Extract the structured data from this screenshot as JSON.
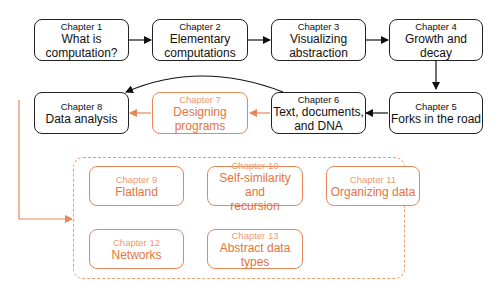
{
  "diagram": {
    "colors": {
      "core": "#222222",
      "optional": "#e57340"
    },
    "chapters": [
      {
        "id": 1,
        "chapter": "Chapter 1",
        "title": "What is computation?",
        "lines": [
          "What is",
          "computation?"
        ],
        "style": "core"
      },
      {
        "id": 2,
        "chapter": "Chapter 2",
        "title": "Elementary computations",
        "lines": [
          "Elementary",
          "computations"
        ],
        "style": "core"
      },
      {
        "id": 3,
        "chapter": "Chapter 3",
        "title": "Visualizing abstraction",
        "lines": [
          "Visualizing",
          "abstraction"
        ],
        "style": "core"
      },
      {
        "id": 4,
        "chapter": "Chapter 4",
        "title": "Growth and decay",
        "lines": [
          "Growth and decay"
        ],
        "style": "core"
      },
      {
        "id": 5,
        "chapter": "Chapter 5",
        "title": "Forks in the road",
        "lines": [
          "Forks in the road"
        ],
        "style": "core"
      },
      {
        "id": 6,
        "chapter": "Chapter 6",
        "title": "Text, documents, and DNA",
        "lines": [
          "Text, documents,",
          "and DNA"
        ],
        "style": "core"
      },
      {
        "id": 7,
        "chapter": "Chapter 7",
        "title": "Designing programs",
        "lines": [
          "Designing",
          "programs"
        ],
        "style": "optional"
      },
      {
        "id": 8,
        "chapter": "Chapter 8",
        "title": "Data analysis",
        "lines": [
          "Data analysis"
        ],
        "style": "core"
      },
      {
        "id": 9,
        "chapter": "Chapter 9",
        "title": "Flatland",
        "lines": [
          "Flatland"
        ],
        "style": "optional"
      },
      {
        "id": 10,
        "chapter": "Chapter 10",
        "title": "Self-similarity and recursion",
        "lines": [
          "Self-similarity and",
          "recursion"
        ],
        "style": "optional"
      },
      {
        "id": 11,
        "chapter": "Chapter 11",
        "title": "Organizing data",
        "lines": [
          "Organizing data"
        ],
        "style": "optional"
      },
      {
        "id": 12,
        "chapter": "Chapter 12",
        "title": "Networks",
        "lines": [
          "Networks"
        ],
        "style": "optional"
      },
      {
        "id": 13,
        "chapter": "Chapter 13",
        "title": "Abstract data types",
        "lines": [
          "Abstract data",
          "types"
        ],
        "style": "optional"
      }
    ],
    "edges": [
      {
        "from": 1,
        "to": 2,
        "style": "core"
      },
      {
        "from": 2,
        "to": 3,
        "style": "core"
      },
      {
        "from": 3,
        "to": 4,
        "style": "core"
      },
      {
        "from": 4,
        "to": 5,
        "style": "core"
      },
      {
        "from": 5,
        "to": 6,
        "style": "core"
      },
      {
        "from": 6,
        "to": 8,
        "style": "core",
        "curved": true
      },
      {
        "from": 6,
        "to": 7,
        "style": "optional"
      },
      {
        "from": 7,
        "to": 8,
        "style": "optional"
      },
      {
        "from": 8,
        "to": "group-9-13",
        "style": "optional"
      }
    ]
  }
}
